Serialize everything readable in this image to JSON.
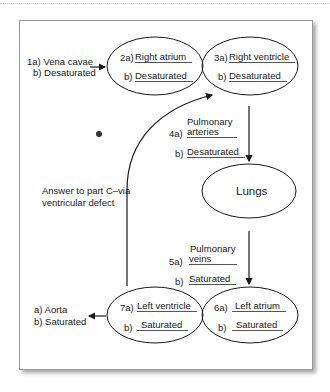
{
  "diagram": {
    "type": "blood-flow-through-heart",
    "nodes": {
      "vena_cavae": {
        "a_prefix": "1a)",
        "a_label": "Vena cavae",
        "b_prefix": "b)",
        "b_label": "Desaturated"
      },
      "right_atrium": {
        "a_prefix": "2a)",
        "a_label": "Right atrium",
        "b_prefix": "b)",
        "b_label": "Desaturated"
      },
      "right_ventricle": {
        "a_prefix": "3a)",
        "a_label": "Right ventricle",
        "b_prefix": "b)",
        "b_label": "Desaturated"
      },
      "pulmonary_arteries": {
        "a_prefix": "4a)",
        "a_label_line1": "Pulmonary",
        "a_label_line2": "arteries",
        "b_prefix": "b)",
        "b_label": "Desaturated"
      },
      "lungs": {
        "label": "Lungs"
      },
      "pulmonary_veins": {
        "a_prefix": "5a)",
        "a_label_line1": "Pulmonary",
        "a_label_line2": "veins",
        "b_prefix": "b)",
        "b_label": "Saturated"
      },
      "left_atrium": {
        "a_prefix": "6a)",
        "a_label": "Left atrium",
        "b_prefix": "b)",
        "b_label": "Saturated"
      },
      "left_ventricle": {
        "a_prefix": "7a)",
        "a_label": "Left ventricle",
        "b_prefix": "b)",
        "b_label": "Saturated"
      },
      "aorta": {
        "a_prefix": "a)",
        "a_label": "Aorta",
        "b_prefix": "b)",
        "b_label": "Saturated"
      }
    },
    "annotation": {
      "line1": "Answer to part C–via",
      "line2": "ventricular defect"
    },
    "edges": [
      {
        "from": "vena_cavae",
        "to": "right_atrium"
      },
      {
        "from": "right_ventricle",
        "to": "lungs",
        "via": "pulmonary_arteries"
      },
      {
        "from": "lungs",
        "to": "left_atrium",
        "via": "pulmonary_veins"
      },
      {
        "from": "left_ventricle",
        "to": "aorta"
      },
      {
        "from": "left_ventricle",
        "to": "right_ventricle",
        "label": "ventricular defect"
      }
    ],
    "colors": {
      "stroke": "#1a1a1a",
      "underline": "#555555",
      "card_border": "#9a9a9a"
    }
  }
}
